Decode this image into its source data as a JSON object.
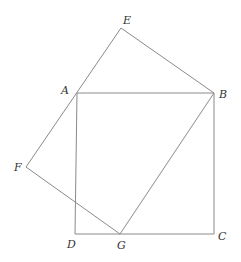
{
  "diagram": {
    "points": {
      "E": {
        "label": "E",
        "x": 121,
        "y": 28
      },
      "A": {
        "label": "A",
        "x": 77,
        "y": 93
      },
      "B": {
        "label": "B",
        "x": 214,
        "y": 93
      },
      "F": {
        "label": "F",
        "x": 26,
        "y": 167
      },
      "D": {
        "label": "D",
        "x": 75,
        "y": 234
      },
      "G": {
        "label": "G",
        "x": 120,
        "y": 234
      },
      "C": {
        "label": "C",
        "x": 214,
        "y": 234
      }
    },
    "shapes": [
      "square ABCD",
      "quadrilateral EBGF"
    ]
  }
}
